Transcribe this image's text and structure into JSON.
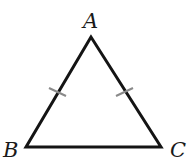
{
  "diagram": {
    "type": "isosceles-triangle",
    "vertices": {
      "A": {
        "label": "A"
      },
      "B": {
        "label": "B"
      },
      "C": {
        "label": "C"
      }
    },
    "congruent_sides": [
      "AB",
      "AC"
    ],
    "colors": {
      "stroke": "#141414",
      "tick": "#8a8a8a"
    }
  }
}
